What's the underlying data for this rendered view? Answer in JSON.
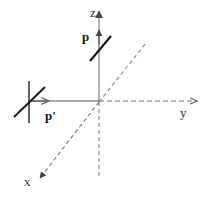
{
  "diagram": {
    "axes": {
      "x": {
        "label": "x",
        "style": "dashed"
      },
      "y": {
        "label": "y",
        "style": "dashed"
      },
      "z": {
        "label": "z",
        "style": "solid-above-origin, dashed-below"
      }
    },
    "vectors": {
      "p": {
        "label": "p",
        "along_axis": "z"
      },
      "p_prime": {
        "label": "p'",
        "direction": "toward origin along -y"
      }
    },
    "colors": {
      "dashed_axis": "#777777",
      "solid_line": "#555555",
      "bold_stroke": "#111111",
      "background": "#ffffff"
    }
  }
}
